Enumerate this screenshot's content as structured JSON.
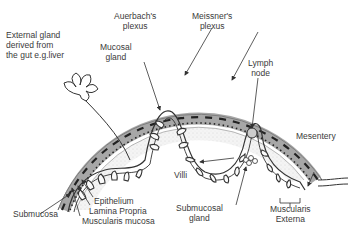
{
  "figure": {
    "colors": {
      "background": "#ffffff",
      "line": "#333333",
      "muscle_band": "#8a8a8a",
      "stipple": "#e4e4e4",
      "text": "#3a3a3a"
    }
  },
  "labels": {
    "external_gland": [
      "External gland",
      "derived from",
      "the gut e.g.liver"
    ],
    "auerbach": [
      "Auerbach's",
      "plexus"
    ],
    "meissner": [
      "Meissner's",
      "plexus"
    ],
    "mucosal_gland": [
      "Mucosal",
      "gland"
    ],
    "lymph_node": [
      "Lymph",
      "node"
    ],
    "mesentery": "Mesentery",
    "villi": "Villi",
    "epithelium": "Epithelium",
    "lamina_propria": "Lamina Propria",
    "muscularis_mucosa": "Muscularis mucosa",
    "submucosa": "Submucosa",
    "submucosal_gland": [
      "Submucosal",
      "gland"
    ],
    "muscularis_externa": [
      "Muscularis",
      "Externa"
    ]
  }
}
